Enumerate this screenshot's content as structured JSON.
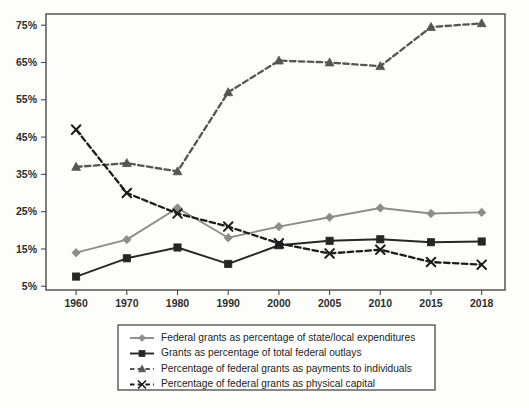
{
  "chart_data": {
    "type": "line",
    "title": "",
    "subtitle": "",
    "xlabel": "",
    "ylabel": "",
    "categories": [
      "1960",
      "1970",
      "1980",
      "1990",
      "2000",
      "2005",
      "2010",
      "2015",
      "2018"
    ],
    "ytick_labels": [
      "5%",
      "15%",
      "25%",
      "35%",
      "45%",
      "55%",
      "65%",
      "75%"
    ],
    "ytick_values": [
      5,
      15,
      25,
      35,
      45,
      55,
      65,
      75
    ],
    "ylim": [
      4.0,
      78.0
    ],
    "grid": false,
    "legend_position": "bottom",
    "series": [
      {
        "name": "Federal grants as percentage of state/local expenditures",
        "marker": "diamond",
        "line_style": "solid",
        "color": "#8c8c8c",
        "values": [
          14.0,
          17.5,
          26.0,
          18.0,
          21.0,
          23.5,
          26.0,
          24.5,
          24.8
        ]
      },
      {
        "name": "Grants as percentage of total federal outlays",
        "marker": "square",
        "line_style": "solid",
        "color": "#262626",
        "values": [
          7.6,
          12.5,
          15.4,
          11.0,
          16.0,
          17.2,
          17.6,
          16.8,
          17.0
        ]
      },
      {
        "name": "Percentage of federal grants as payments to individuals",
        "marker": "triangle",
        "line_style": "dashed",
        "color": "#555555",
        "values": [
          37.0,
          38.0,
          35.8,
          57.0,
          65.5,
          65.0,
          64.0,
          74.5,
          75.5
        ]
      },
      {
        "name": "Percentage of federal grants as physical capital",
        "marker": "x",
        "line_style": "dashed",
        "color": "#1c1c1c",
        "values": [
          47.0,
          30.0,
          24.5,
          21.0,
          16.5,
          13.8,
          14.8,
          11.5,
          10.8
        ]
      }
    ]
  },
  "colors": {
    "background": "#fdfdfb",
    "axis": "#4a4a4a",
    "text": "#2b2b2b",
    "legend_border": "#3a3a3a"
  }
}
